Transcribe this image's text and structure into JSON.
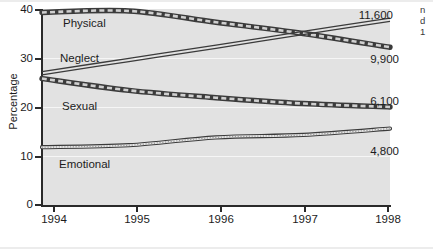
{
  "chart_data": {
    "type": "line",
    "title": "",
    "xlabel": "",
    "ylabel": "Percentage",
    "xlim": [
      1994,
      1998
    ],
    "ylim": [
      0,
      40
    ],
    "grid": true,
    "legend_position": "inline-labels",
    "x": [
      1994,
      1995,
      1996,
      1997,
      1998
    ],
    "xticklabels": [
      "1994",
      "1995",
      "1996",
      "1997",
      "1998"
    ],
    "yticklabels": [
      "0",
      "10",
      "20",
      "30",
      "40"
    ],
    "yticks": [
      0,
      10,
      20,
      30,
      40
    ],
    "series": [
      {
        "name": "Physical",
        "label": "Physical",
        "style": "thick-dashed",
        "end_annotation": "9,900",
        "values": [
          39.3,
          39.6,
          37.3,
          35.0,
          32.2
        ]
      },
      {
        "name": "Neglect",
        "label": "Neglect",
        "style": "thin-double",
        "end_annotation": "11,600",
        "values": [
          26.9,
          29.6,
          32.3,
          35.1,
          37.8
        ]
      },
      {
        "name": "Sexual",
        "label": "Sexual",
        "style": "thick-dashed",
        "end_annotation": "6,100",
        "values": [
          25.8,
          23.4,
          21.9,
          20.7,
          20.0
        ]
      },
      {
        "name": "Emotional",
        "label": "Emotional",
        "style": "thin-dotted-fill",
        "end_annotation": "4,800",
        "values": [
          11.8,
          12.2,
          13.8,
          14.3,
          15.6
        ]
      }
    ],
    "annotations": [
      {
        "text": "11,600",
        "series": "Neglect"
      },
      {
        "text": "9,900",
        "series": "Physical"
      },
      {
        "text": "6,100",
        "series": "Sexual"
      },
      {
        "text": "4,800",
        "series": "Emotional"
      }
    ]
  },
  "margin_note_fragments": [
    "n",
    "d",
    "1"
  ],
  "colors": {
    "plot_background": "#e2e2e2",
    "page_background": "#ffffff",
    "gridline": "#f6f6f6",
    "axis": "#2a2a2a",
    "line": "#3b3b3b",
    "text": "#1c1c1c"
  }
}
